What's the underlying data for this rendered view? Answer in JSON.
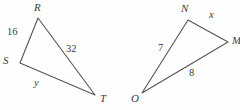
{
  "figure": {
    "stroke_color": "#555555",
    "text_color": "#3a3a3a",
    "background_color": "#fefefe",
    "triangles": [
      {
        "name": "triangle-rst",
        "vertices": [
          {
            "name": "R",
            "label": "R",
            "x": 38,
            "y": 18,
            "label_x": 34,
            "label_y": 2
          },
          {
            "name": "S",
            "label": "S",
            "x": 20,
            "y": 63,
            "label_x": 3,
            "label_y": 55
          },
          {
            "name": "T",
            "label": "T",
            "x": 95,
            "y": 95,
            "label_x": 100,
            "label_y": 93
          }
        ],
        "sides": [
          {
            "name": "RS",
            "label": "16",
            "label_x": 7,
            "label_y": 27,
            "is_variable": false
          },
          {
            "name": "RT",
            "label": "32",
            "label_x": 66,
            "label_y": 44,
            "is_variable": false
          },
          {
            "name": "ST",
            "label": "y",
            "label_x": 34,
            "label_y": 78,
            "is_variable": true
          }
        ]
      },
      {
        "name": "triangle-nmo",
        "vertices": [
          {
            "name": "N",
            "label": "N",
            "x": 188,
            "y": 20,
            "label_x": 181,
            "label_y": 3
          },
          {
            "name": "M",
            "label": "M",
            "x": 228,
            "y": 42,
            "label_x": 232,
            "label_y": 35
          },
          {
            "name": "O",
            "label": "O",
            "x": 142,
            "y": 93,
            "label_x": 131,
            "label_y": 93
          }
        ],
        "sides": [
          {
            "name": "NM",
            "label": "x",
            "label_x": 209,
            "label_y": 10,
            "is_variable": true
          },
          {
            "name": "NO",
            "label": "7",
            "label_x": 158,
            "label_y": 43,
            "is_variable": false
          },
          {
            "name": "OM",
            "label": "8",
            "label_x": 189,
            "label_y": 68,
            "is_variable": false
          }
        ]
      }
    ]
  }
}
